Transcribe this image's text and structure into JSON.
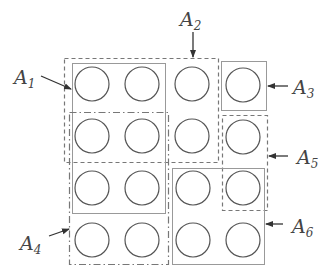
{
  "diagram": {
    "grid": {
      "rows": 4,
      "cols": 4,
      "circle_count": 15,
      "circle_color": "#555555",
      "positions": [
        [
          1,
          1
        ],
        [
          1,
          2
        ],
        [
          1,
          3
        ],
        [
          1,
          4
        ],
        [
          2,
          1
        ],
        [
          2,
          2
        ],
        [
          2,
          3
        ],
        [
          2,
          4
        ],
        [
          3,
          1
        ],
        [
          3,
          2
        ],
        [
          3,
          4
        ],
        [
          4,
          1
        ],
        [
          4,
          2
        ],
        [
          4,
          3
        ],
        [
          4,
          4
        ]
      ]
    },
    "regions": [
      {
        "id": "A1",
        "base": "A",
        "sub": "1",
        "style": "solid-thin"
      },
      {
        "id": "A2",
        "base": "A",
        "sub": "2",
        "style": "dashed"
      },
      {
        "id": "A3",
        "base": "A",
        "sub": "3",
        "style": "solid-thin"
      },
      {
        "id": "A4",
        "base": "A",
        "sub": "4",
        "style": "dash-dot"
      },
      {
        "id": "A5",
        "base": "A",
        "sub": "5",
        "style": "dashed"
      },
      {
        "id": "A6",
        "base": "A",
        "sub": "6",
        "style": "solid-thin"
      }
    ]
  }
}
